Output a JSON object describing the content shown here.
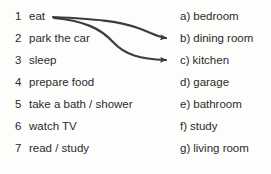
{
  "exercise": {
    "type": "matching-exercise",
    "background_color": "#fdfdfc",
    "text_color": "#2b2b2b",
    "arrow_color": "#3c3c3c",
    "left_column": [
      {
        "marker": "1",
        "label": "eat"
      },
      {
        "marker": "2",
        "label": "park the car"
      },
      {
        "marker": "3",
        "label": "sleep"
      },
      {
        "marker": "4",
        "label": "prepare food"
      },
      {
        "marker": "5",
        "label": "take a bath / shower"
      },
      {
        "marker": "6",
        "label": "watch TV"
      },
      {
        "marker": "7",
        "label": "read / study"
      }
    ],
    "right_column": [
      {
        "marker": "a)",
        "label": "bedroom"
      },
      {
        "marker": "b)",
        "label": "dining room"
      },
      {
        "marker": "c)",
        "label": "kitchen"
      },
      {
        "marker": "d)",
        "label": "garage"
      },
      {
        "marker": "e)",
        "label": "bathroom"
      },
      {
        "marker": "f)",
        "label": "study"
      },
      {
        "marker": "g)",
        "label": "living room"
      }
    ],
    "connections": [
      {
        "name": "arrow-eat-to-dining-room",
        "from_marker": "1",
        "from_label": "eat",
        "to_marker": "b)",
        "to_label": "dining room",
        "path": "M 53 17 C 96 19, 118 21, 138 28 C 152 33, 158 37, 166 38",
        "arrow_x": 172,
        "arrow_y": 38
      },
      {
        "name": "arrow-eat-to-kitchen",
        "from_marker": "1",
        "from_label": "eat",
        "to_marker": "c)",
        "to_label": "kitchen",
        "path": "M 54 18 C 84 21, 100 28, 113 42 C 125 55, 140 59, 166 60",
        "arrow_x": 172,
        "arrow_y": 60
      }
    ],
    "row_geometry": {
      "first_row_center_y": 17,
      "row_spacing": 22
    }
  }
}
